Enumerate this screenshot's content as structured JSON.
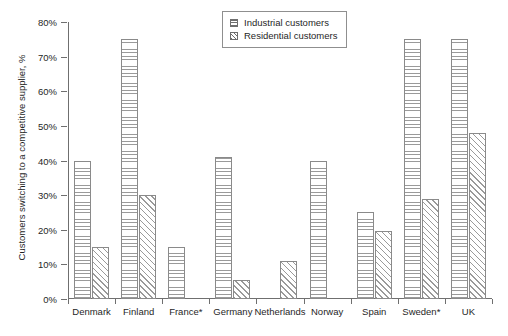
{
  "chart_data": {
    "type": "bar",
    "title": "",
    "xlabel": "",
    "ylabel": "Customers switching to a competitive supplier, %",
    "ylim": [
      0,
      80
    ],
    "ytick_labels": [
      "0%",
      "10%",
      "20%",
      "30%",
      "40%",
      "50%",
      "60%",
      "70%",
      "80%"
    ],
    "ytick_values": [
      0,
      10,
      20,
      30,
      40,
      50,
      60,
      70,
      80
    ],
    "grid": false,
    "legend_position": "top-center",
    "categories": [
      "Denmark",
      "Finland",
      "France*",
      "Germany",
      "Netherlands",
      "Norway",
      "Spain",
      "Sweden*",
      "UK"
    ],
    "series": [
      {
        "name": "Industrial customers",
        "pattern": "horizontal-lines",
        "values": [
          40,
          75,
          15,
          41,
          null,
          40,
          25,
          75,
          75
        ]
      },
      {
        "name": "Residential customers",
        "pattern": "diagonal-hatch",
        "values": [
          15,
          30,
          null,
          5.5,
          11,
          null,
          19.5,
          29,
          48
        ]
      }
    ]
  },
  "legend": {
    "items": [
      {
        "label": "Industrial customers",
        "swatch": "industrial"
      },
      {
        "label": "Residential customers",
        "swatch": "residential"
      }
    ]
  }
}
